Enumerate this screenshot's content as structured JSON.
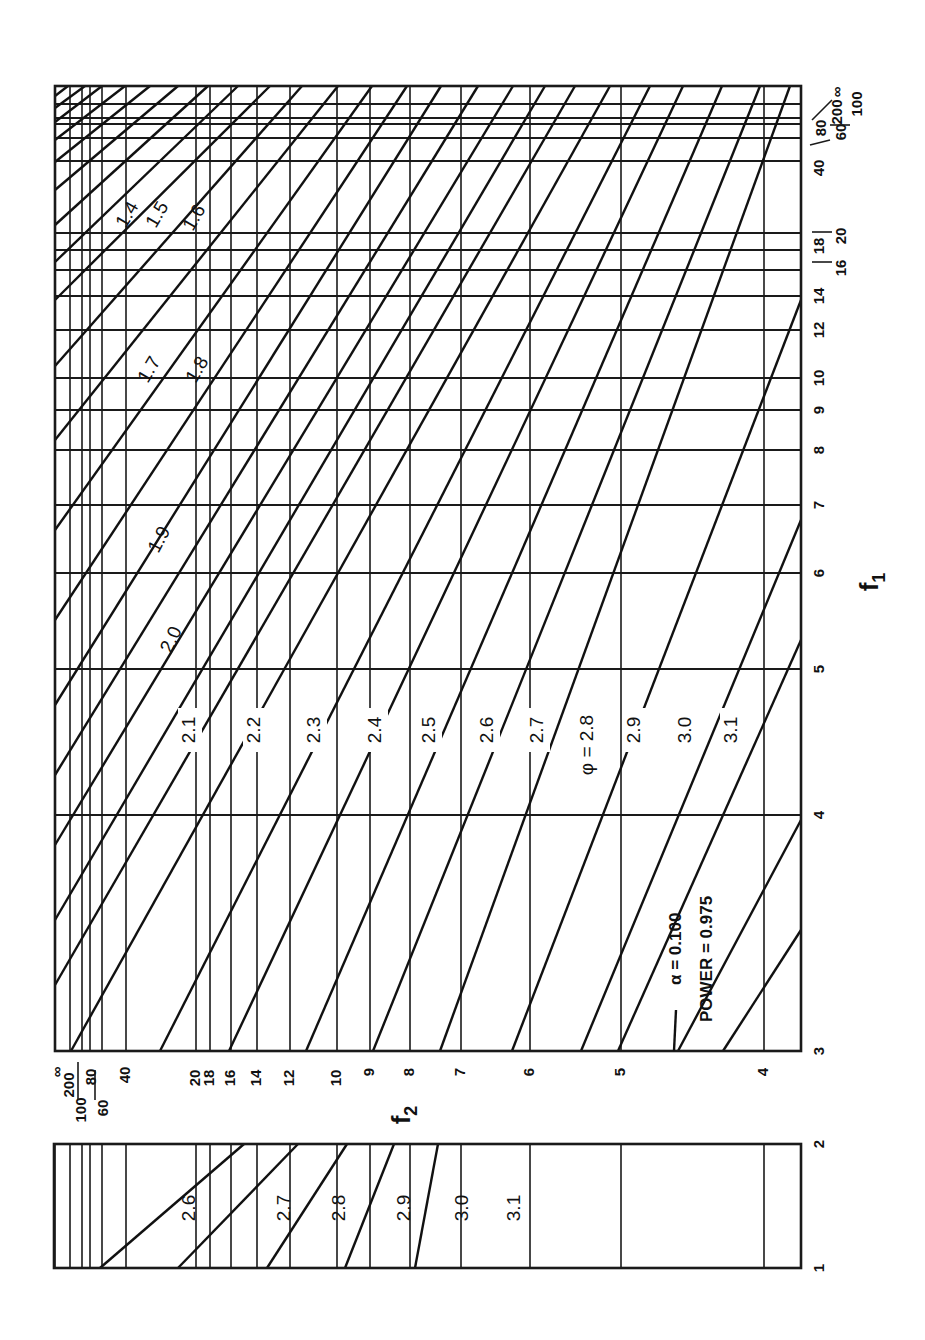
{
  "chart_data": [
    {
      "type": "line",
      "title": "Power function chart (rotated 90°): alpha = 0.100, power = 0.975",
      "orientation": "rotated-90-ccw",
      "xlabel": "f1",
      "ylabel": "f2",
      "annotations": [
        "α = 0.100",
        "POWER = 0.975",
        "φ = 2.8"
      ],
      "f1_ticks": [
        "3",
        "4",
        "5",
        "6",
        "7",
        "8",
        "9",
        "10",
        "12",
        "14",
        "16",
        "18",
        "20",
        "40",
        "60",
        "80",
        "100",
        "200",
        "∞"
      ],
      "f2_ticks": [
        "∞",
        "200",
        "100",
        "80",
        "60",
        "40",
        "20",
        "18",
        "16",
        "14",
        "12",
        "10",
        "9",
        "8",
        "7",
        "6",
        "5",
        "4"
      ],
      "phi_curves": [
        "1.4",
        "1.5",
        "1.6",
        "1.7",
        "1.8",
        "1.9",
        "2.0",
        "2.1",
        "2.2",
        "2.3",
        "2.4",
        "2.5",
        "2.6",
        "2.7",
        "2.8",
        "2.9",
        "3.0",
        "3.1"
      ],
      "grid": true,
      "f1_range": [
        3,
        "∞"
      ]
    },
    {
      "type": "line",
      "title": "Inset: f1 from 1 to 2",
      "xlabel": "f1",
      "ylabel": "f2",
      "f1_ticks": [
        "1",
        "2"
      ],
      "phi_curves": [
        "2.6",
        "2.7",
        "2.8",
        "2.9",
        "3.0",
        "3.1"
      ],
      "grid": true,
      "f1_range": [
        1,
        2
      ]
    }
  ],
  "labels": {
    "f1_axis": "f",
    "f1_sub": "1",
    "f2_axis": "f",
    "f2_sub": "2",
    "alpha": "α  =  0.100",
    "power": "POWER = 0.975",
    "phi_prefix": "φ = "
  },
  "main": {
    "frame": {
      "x0": 55,
      "y0": 86,
      "x1": 801,
      "y1": 1051
    },
    "f1_lines": [
      {
        "v": "∞",
        "y": 86
      },
      {
        "v": "200",
        "y": 104
      },
      {
        "v": "100",
        "y": 118
      },
      {
        "v": "80",
        "y": 124
      },
      {
        "v": "60",
        "y": 138
      },
      {
        "v": "40",
        "y": 161
      },
      {
        "v": "20",
        "y": 233
      },
      {
        "v": "18",
        "y": 250
      },
      {
        "v": "16",
        "y": 270
      },
      {
        "v": "14",
        "y": 296
      },
      {
        "v": "12",
        "y": 330
      },
      {
        "v": "10",
        "y": 378
      },
      {
        "v": "9",
        "y": 410
      },
      {
        "v": "8",
        "y": 450
      },
      {
        "v": "7",
        "y": 505
      },
      {
        "v": "6",
        "y": 573
      },
      {
        "v": "5",
        "y": 669
      },
      {
        "v": "4",
        "y": 815
      },
      {
        "v": "3",
        "y": 1051
      }
    ],
    "f2_lines": [
      {
        "v": "∞",
        "x": 55
      },
      {
        "v": "200",
        "x": 70
      },
      {
        "v": "100",
        "x": 82
      },
      {
        "v": "80",
        "x": 90
      },
      {
        "v": "60",
        "x": 102
      },
      {
        "v": "40",
        "x": 126
      },
      {
        "v": "20",
        "x": 196
      },
      {
        "v": "18",
        "x": 210
      },
      {
        "v": "16",
        "x": 231
      },
      {
        "v": "14",
        "x": 257
      },
      {
        "v": "12",
        "x": 290
      },
      {
        "v": "10",
        "x": 337
      },
      {
        "v": "9",
        "x": 370
      },
      {
        "v": "8",
        "x": 410
      },
      {
        "v": "7",
        "x": 461
      },
      {
        "v": "6",
        "x": 530
      },
      {
        "v": "5",
        "x": 621
      },
      {
        "v": "4",
        "x": 764
      }
    ],
    "curves": [
      {
        "x1": 55,
        "y1": 96,
        "x2": 68,
        "y2": 86
      },
      {
        "x1": 55,
        "y1": 108,
        "x2": 85,
        "y2": 86
      },
      {
        "x1": 55,
        "y1": 122,
        "x2": 102,
        "y2": 86
      },
      {
        "x1": 55,
        "y1": 140,
        "x2": 125,
        "y2": 86
      },
      {
        "x1": 55,
        "y1": 162,
        "x2": 150,
        "y2": 86
      },
      {
        "x1": 55,
        "y1": 190,
        "x2": 178,
        "y2": 86
      },
      {
        "x1": 55,
        "y1": 225,
        "x2": 208,
        "y2": 86
      },
      {
        "x1": 55,
        "y1": 262,
        "x2": 238,
        "y2": 86
      },
      {
        "x1": 55,
        "y1": 300,
        "x2": 270,
        "y2": 86
      },
      {
        "x1": 55,
        "y1": 366,
        "x2": 302,
        "y2": 86
      },
      {
        "x1": 55,
        "y1": 440,
        "x2": 338,
        "y2": 86
      },
      {
        "x1": 55,
        "y1": 530,
        "x2": 372,
        "y2": 86
      },
      {
        "x1": 55,
        "y1": 620,
        "x2": 407,
        "y2": 86
      },
      {
        "x1": 55,
        "y1": 705,
        "x2": 441,
        "y2": 86
      },
      {
        "x1": 55,
        "y1": 775,
        "x2": 478,
        "y2": 86
      },
      {
        "x1": 55,
        "y1": 845,
        "x2": 513,
        "y2": 86
      },
      {
        "x1": 55,
        "y1": 920,
        "x2": 545,
        "y2": 86
      },
      {
        "x1": 55,
        "y1": 985,
        "x2": 575,
        "y2": 86
      },
      {
        "x1": 71,
        "y1": 1051,
        "x2": 610,
        "y2": 86
      },
      {
        "x1": 160,
        "y1": 1051,
        "x2": 650,
        "y2": 86
      },
      {
        "x1": 229,
        "y1": 1051,
        "x2": 683,
        "y2": 86
      },
      {
        "x1": 306,
        "y1": 1051,
        "x2": 722,
        "y2": 86
      },
      {
        "x1": 373,
        "y1": 1051,
        "x2": 760,
        "y2": 86
      },
      {
        "x1": 440,
        "y1": 1051,
        "x2": 790,
        "y2": 86
      },
      {
        "x1": 512,
        "y1": 1051,
        "x2": 801,
        "y2": 300
      },
      {
        "x1": 581,
        "y1": 1051,
        "x2": 801,
        "y2": 520
      },
      {
        "x1": 618,
        "y1": 1051,
        "x2": 801,
        "y2": 640
      },
      {
        "x1": 678,
        "y1": 1051,
        "x2": 801,
        "y2": 820
      },
      {
        "x1": 723,
        "y1": 1051,
        "x2": 801,
        "y2": 930
      }
    ],
    "phi_label_positions": [
      {
        "t": "1.4",
        "x": 128,
        "y": 215,
        "r": -60
      },
      {
        "t": "1.5",
        "x": 158,
        "y": 215,
        "r": -60
      },
      {
        "t": "1.6",
        "x": 195,
        "y": 218,
        "r": -60
      },
      {
        "t": "1.7",
        "x": 150,
        "y": 370,
        "r": -60
      },
      {
        "t": "1.8",
        "x": 198,
        "y": 370,
        "r": -60
      },
      {
        "t": "1.9",
        "x": 160,
        "y": 540,
        "r": -62
      },
      {
        "t": "2.0",
        "x": 172,
        "y": 640,
        "r": -65
      },
      {
        "t": "2.1",
        "x": 190,
        "y": 730,
        "r": -90
      },
      {
        "t": "2.2",
        "x": 255,
        "y": 730,
        "r": -90
      },
      {
        "t": "2.3",
        "x": 315,
        "y": 730,
        "r": -90
      },
      {
        "t": "2.4",
        "x": 376,
        "y": 730,
        "r": -90
      },
      {
        "t": "2.5",
        "x": 430,
        "y": 730,
        "r": -90
      },
      {
        "t": "2.6",
        "x": 488,
        "y": 730,
        "r": -90
      },
      {
        "t": "2.7",
        "x": 538,
        "y": 730,
        "r": -90
      },
      {
        "t": "φ = 2.8",
        "x": 588,
        "y": 745,
        "r": -90
      },
      {
        "t": "2.9",
        "x": 635,
        "y": 730,
        "r": -90
      },
      {
        "t": "3.0",
        "x": 686,
        "y": 730,
        "r": -90
      },
      {
        "t": "3.1",
        "x": 732,
        "y": 730,
        "r": -90
      }
    ]
  },
  "inset": {
    "frame": {
      "x0": 54,
      "y0": 1144,
      "x1": 801,
      "y1": 1268
    },
    "f1_ticks": [
      {
        "v": "2",
        "y": 1144
      },
      {
        "v": "1",
        "y": 1268
      }
    ],
    "curves": [
      {
        "x1": 100,
        "y1": 1268,
        "x2": 244,
        "y2": 1144
      },
      {
        "x1": 178,
        "y1": 1268,
        "x2": 298,
        "y2": 1144
      },
      {
        "x1": 267,
        "y1": 1268,
        "x2": 347,
        "y2": 1144
      },
      {
        "x1": 345,
        "y1": 1268,
        "x2": 394,
        "y2": 1144
      },
      {
        "x1": 415,
        "y1": 1268,
        "x2": 438,
        "y2": 1144
      }
    ],
    "phi_label_positions": [
      {
        "t": "2.6",
        "x": 190,
        "y": 1208
      },
      {
        "t": "2.7",
        "x": 285,
        "y": 1208
      },
      {
        "t": "2.8",
        "x": 340,
        "y": 1208
      },
      {
        "t": "2.9",
        "x": 405,
        "y": 1208
      },
      {
        "t": "3.0",
        "x": 463,
        "y": 1208
      },
      {
        "t": "3.1",
        "x": 515,
        "y": 1208
      }
    ]
  }
}
